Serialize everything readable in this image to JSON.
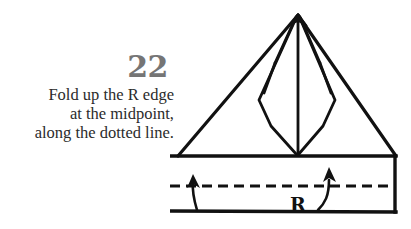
{
  "page": {
    "background_color": "#ffffff",
    "width": 411,
    "height": 229
  },
  "instruction": {
    "step_number": "22",
    "step_number_color": "#757575",
    "text_color": "#2b2b2b",
    "lines": [
      "Fold up the R edge",
      "at the midpoint,",
      "along the dotted line."
    ],
    "line1": "Fold up the R edge",
    "line2": "at the midpoint,",
    "line3": "along the dotted line."
  },
  "diagram": {
    "ink_color": "#111111",
    "labels": {
      "r_edge": "R"
    },
    "elements": {
      "outer_triangle": "triangle-apex-top",
      "bottom_band": "rectangle-band",
      "fold_line": "horizontal-dashed-fold-line",
      "left_arrow": "curved-up-arrow-left",
      "right_arrow": "curved-up-arrow-right",
      "inner_flaps": "kite-diamond-flaps"
    }
  }
}
